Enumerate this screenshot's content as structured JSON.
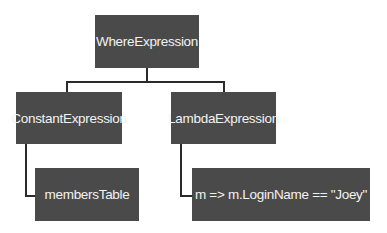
{
  "diagram": {
    "type": "expression-tree",
    "root": {
      "label": "WhereExpression",
      "children": [
        {
          "label": "ConstantExpression",
          "children": [
            {
              "label": "membersTable"
            }
          ]
        },
        {
          "label": "LambdaExpression",
          "children": [
            {
              "label": "m => m.LoginName == \"Joey\""
            }
          ]
        }
      ]
    },
    "colors": {
      "node_fill": "#4a4a4a",
      "node_text": "#f2f2f2",
      "connector": "#2a2a2a",
      "background": "#ffffff"
    }
  }
}
